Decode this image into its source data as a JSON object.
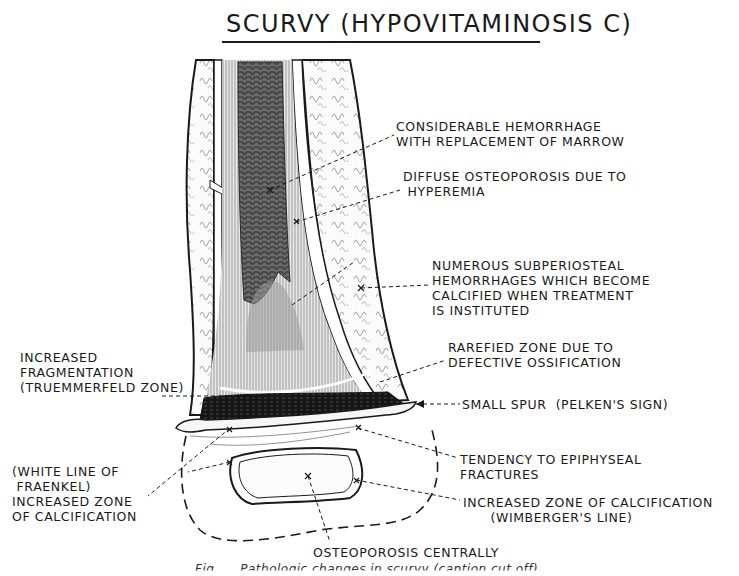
{
  "figure": {
    "title": "SCURVY (HYPOVITAMINOSIS C)",
    "caption_partial": "Fig. ... Pathologic changes in scurvy (caption cut off)"
  },
  "labels": [
    {
      "id": "marrow-hemorrhage",
      "text": "CONSIDERABLE HEMORRHAGE\nWITH REPLACEMENT OF MARROW",
      "x": 396,
      "y": 119
    },
    {
      "id": "diffuse-osteoporosis",
      "text": "DIFFUSE OSTEOPOROSIS DUE TO\n HYPEREMIA",
      "x": 403,
      "y": 169
    },
    {
      "id": "subperiosteal-hemorrhages",
      "text": "NUMEROUS SUBPERIOSTEAL\nHEMORRHAGES WHICH BECOME\nCALCIFIED WHEN TREATMENT\nIS INSTITUTED",
      "x": 432,
      "y": 258
    },
    {
      "id": "rarefied-zone",
      "text": "RAREFIED ZONE DUE TO\nDEFECTIVE OSSIFICATION",
      "x": 448,
      "y": 340
    },
    {
      "id": "small-spur",
      "text": "SMALL SPUR  (PELKEN'S SIGN)",
      "x": 462,
      "y": 397
    },
    {
      "id": "truemmerfeld",
      "text": "INCREASED\nFRAGMENTATION\n(TRUEMMERFELD ZONE)",
      "x": 20,
      "y": 350
    },
    {
      "id": "epiphyseal-fractures",
      "text": "TENDENCY TO EPIPHYSEAL\nFRACTURES",
      "x": 460,
      "y": 452
    },
    {
      "id": "white-line-fraenkel",
      "text": "(WHITE LINE OF\n FRAENKEL)\nINCREASED ZONE\nOF CALCIFICATION",
      "x": 12,
      "y": 464
    },
    {
      "id": "wimberger-line",
      "text": "INCREASED ZONE OF CALCIFICATION\n      (WIMBERGER'S LINE)",
      "x": 463,
      "y": 495
    },
    {
      "id": "osteoporosis-centrally",
      "text": "OSTEOPOROSIS CENTRALLY",
      "x": 313,
      "y": 545
    }
  ]
}
